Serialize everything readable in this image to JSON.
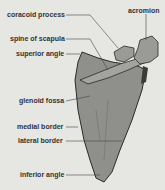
{
  "diagram": {
    "labels": {
      "coracoid_process": "coracoid process",
      "acromion": "acromion",
      "spine_of_scapula": "spine of scapula",
      "superior_angle": "superior angle",
      "glenoid_fossa": "glenoid fossa",
      "medial_border": "medial border",
      "lateral_border": "lateral border",
      "inferior_angle": "inferior angle"
    },
    "colors": {
      "background": "#e6e6e3",
      "bone_fill": "#8f8f8c",
      "bone_outline": "#2a2a2a",
      "leader_line": "#444444",
      "label_text": "#333333"
    }
  }
}
